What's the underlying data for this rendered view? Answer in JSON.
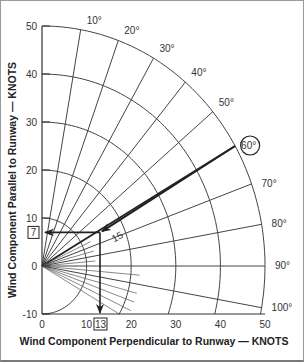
{
  "chart": {
    "type": "crosswind-component-chart",
    "y_axis_label": "Wind Component Parallel to Runway — KNOTS",
    "x_axis_label": "Wind Component Perpendicular to Runway — KNOTS",
    "y_ticks": [
      "50",
      "40",
      "30",
      "20",
      "10",
      "0",
      "-10"
    ],
    "x_ticks": [
      "0",
      "10",
      "20",
      "30",
      "40",
      "50"
    ],
    "angle_labels": [
      "10°",
      "20°",
      "30°",
      "40°",
      "50°",
      "60°",
      "70°",
      "80°",
      "90°",
      "100°"
    ],
    "highlighted_angle": "60°",
    "wind_speed_label": "15",
    "headwind_result": "7",
    "crosswind_result": "13",
    "speed_arcs_knots": [
      10,
      20,
      30,
      40,
      50
    ]
  },
  "chart_data": {
    "type": "polar-component",
    "title": "",
    "xlabel": "Wind Component Perpendicular to Runway — KNOTS",
    "ylabel": "Wind Component Parallel to Runway — KNOTS",
    "xlim": [
      0,
      50
    ],
    "ylim": [
      -10,
      50
    ],
    "angle_lines_deg": [
      0,
      10,
      20,
      30,
      40,
      50,
      60,
      70,
      80,
      90,
      100
    ],
    "speed_arcs_knots": [
      10,
      20,
      30,
      40,
      50
    ],
    "example": {
      "wind_angle_deg": 60,
      "wind_speed_knots": 15,
      "headwind_knots": 7,
      "crosswind_knots": 13
    }
  }
}
